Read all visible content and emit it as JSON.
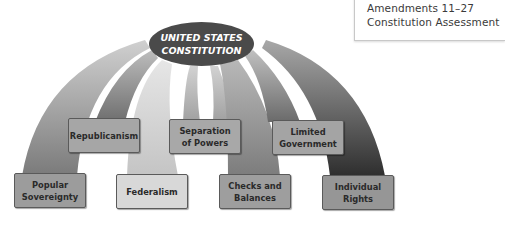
{
  "sidebar_links": {
    "line1": "Amendments 11–27",
    "line2": "Constitution Assessment"
  },
  "diagram": {
    "title_line1": "UNITED STATES",
    "title_line2": "CONSTITUTION",
    "principles": [
      {
        "id": "popular-sovereignty",
        "line1": "Popular",
        "line2": "Sovereignty",
        "color": "#9c9c9c"
      },
      {
        "id": "republicanism",
        "line1": "Republicanism",
        "line2": "",
        "color": "#a6a6a6"
      },
      {
        "id": "federalism",
        "line1": "Federalism",
        "line2": "",
        "color": "#d8d8d8"
      },
      {
        "id": "separation-of-powers",
        "line1": "Separation",
        "line2": "of Powers",
        "color": "#a8a8a8"
      },
      {
        "id": "checks-and-balances",
        "line1": "Checks and",
        "line2": "Balances",
        "color": "#9e9e9e"
      },
      {
        "id": "limited-government",
        "line1": "Limited",
        "line2": "Government",
        "color": "#a4a4a4"
      },
      {
        "id": "individual-rights",
        "line1": "Individual",
        "line2": "Rights",
        "color": "#969696"
      }
    ]
  }
}
